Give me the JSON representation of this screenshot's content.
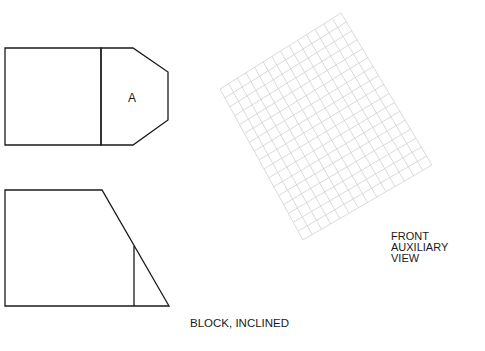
{
  "diagram": {
    "top_view": {
      "label": "A",
      "rect": [
        [
          5,
          48
        ],
        [
          101,
          48
        ],
        [
          101,
          145
        ],
        [
          5,
          145
        ]
      ],
      "polygon": [
        [
          101,
          48
        ],
        [
          133,
          48
        ],
        [
          168,
          72
        ],
        [
          168,
          120
        ],
        [
          133,
          145
        ],
        [
          101,
          145
        ]
      ]
    },
    "front_view": {
      "outline": [
        [
          5,
          190
        ],
        [
          102,
          190
        ],
        [
          169,
          306
        ],
        [
          5,
          306
        ]
      ],
      "inner_line": [
        [
          134,
          246
        ],
        [
          134,
          306
        ]
      ]
    },
    "aux_grid": {
      "corners": [
        [
          220,
          89
        ],
        [
          341,
          13
        ],
        [
          432,
          165
        ],
        [
          303,
          240
        ]
      ],
      "cols": 14,
      "rows": 17,
      "color": "#d0d0d0"
    },
    "labels": {
      "aux_line1": "FRONT",
      "aux_line2": "AUXILIARY",
      "aux_line3": "VIEW",
      "caption": "BLOCK, INCLINED"
    },
    "line_color": "#1a1a1a"
  }
}
